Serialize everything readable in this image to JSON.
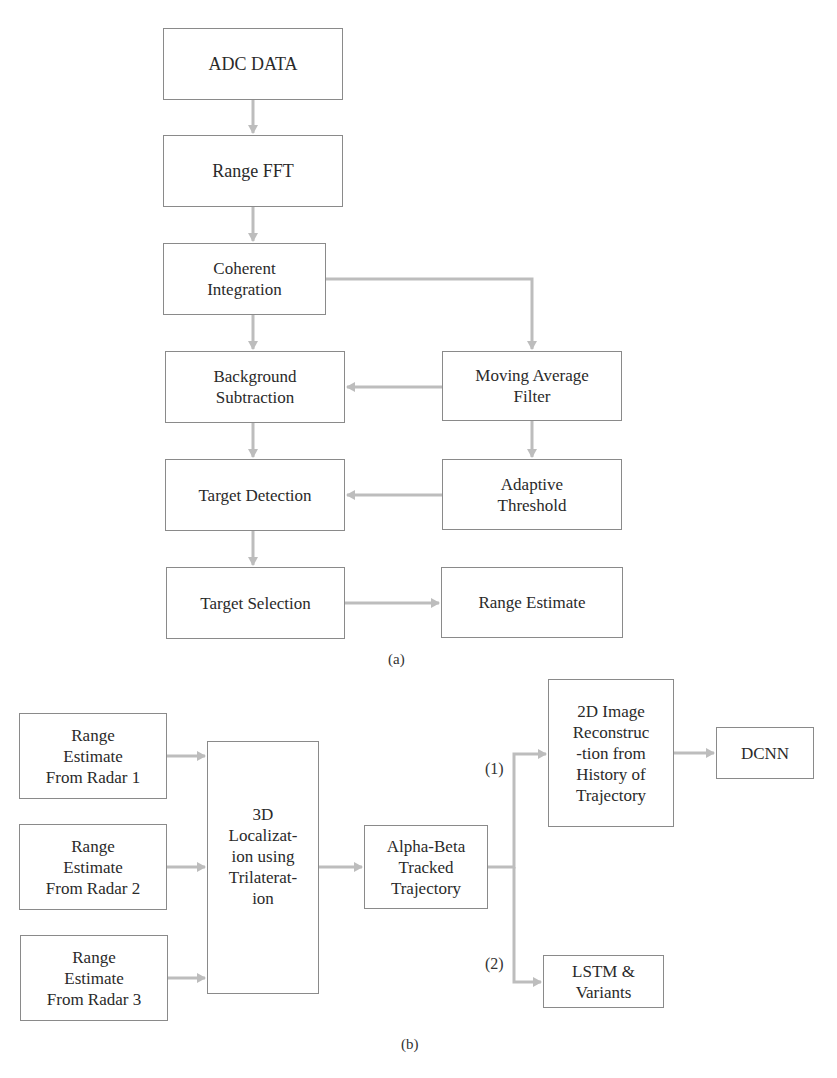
{
  "figure_a": {
    "caption": "(a)",
    "boxes": {
      "adc": "ADC DATA",
      "range_fft": "Range FFT",
      "coherent": [
        "Coherent",
        "Integration"
      ],
      "background": [
        "Background",
        "Subtraction"
      ],
      "moving_avg": [
        "Moving Average",
        "Filter"
      ],
      "target_detection": "Target Detection",
      "adaptive": [
        "Adaptive",
        "Threshold"
      ],
      "target_selection": "Target Selection",
      "range_estimate": "Range Estimate"
    }
  },
  "figure_b": {
    "caption": "(b)",
    "boxes": {
      "radar1": [
        "Range",
        "Estimate",
        "From Radar 1"
      ],
      "radar2": [
        "Range",
        "Estimate",
        "From Radar 2"
      ],
      "radar3": [
        "Range",
        "Estimate",
        "From Radar 3"
      ],
      "localization": [
        "3D",
        "Localizat-",
        "ion using",
        "Trilaterat-",
        "ion"
      ],
      "alpha_beta": [
        "Alpha-Beta",
        "Tracked",
        "Trajectory"
      ],
      "image2d": [
        "2D Image",
        "Reconstruc",
        "-tion from",
        "History of",
        "Trajectory"
      ],
      "dcnn": "DCNN",
      "lstm": [
        "LSTM &",
        "Variants"
      ]
    },
    "branch_labels": [
      "(1)",
      "(2)"
    ]
  },
  "colors": {
    "box_border": "#8a8a8a",
    "arrow": "#bdbdbd",
    "text": "#2a2a2a"
  }
}
